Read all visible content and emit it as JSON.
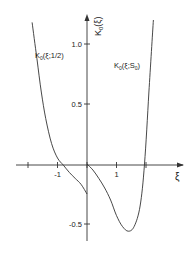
{
  "chart_data": {
    "type": "line",
    "title": "",
    "xlabel": "ξ",
    "ylabel": "K₀(ξ)",
    "xlim": [
      -2.1,
      3.3
    ],
    "ylim": [
      -0.65,
      1.25
    ],
    "grid": false,
    "x_ticks": [
      -2,
      -1,
      0,
      1,
      2
    ],
    "x_tick_labels": [
      "",
      "-1",
      "",
      "1",
      ""
    ],
    "y_ticks": [
      1.0,
      0.5,
      -0.5
    ],
    "y_tick_labels": [
      "1.0",
      "0.5",
      "-0.5"
    ],
    "series": [
      {
        "name": "K₀(ξ;1/2)",
        "label_main": "K",
        "label_sub": "0",
        "label_args": "(ξ;1/2)",
        "x": [
          -1.86,
          -1.7,
          -1.55,
          -1.4,
          -1.2,
          -1.0,
          -0.8,
          -0.6,
          -0.4,
          -0.2,
          0.0
        ],
        "values": [
          1.18,
          0.88,
          0.6,
          0.38,
          0.17,
          0.05,
          -0.01,
          -0.07,
          -0.12,
          -0.17,
          -0.25
        ]
      },
      {
        "name": "K₀(ξ;S₀)",
        "label_main": "K",
        "label_sub": "0",
        "label_args": "(ξ;S",
        "label_args_sub": "0",
        "label_close": ")",
        "x": [
          0.0,
          0.2,
          0.4,
          0.6,
          0.8,
          1.0,
          1.2,
          1.4,
          1.6,
          1.8,
          1.95,
          2.1,
          2.25
        ],
        "values": [
          0.0,
          -0.05,
          -0.12,
          -0.2,
          -0.3,
          -0.43,
          -0.52,
          -0.56,
          -0.52,
          -0.35,
          0.0,
          0.6,
          1.2
        ]
      }
    ]
  }
}
